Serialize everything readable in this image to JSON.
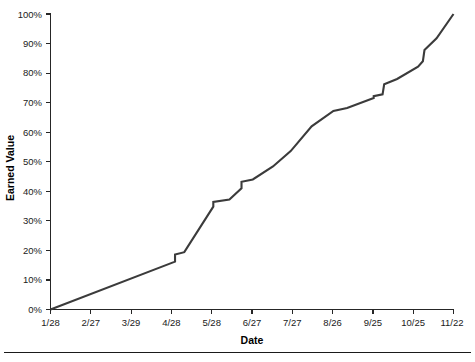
{
  "chart_data": {
    "type": "line",
    "title": "",
    "xlabel": "Date",
    "ylabel": "Earned Value",
    "xtick_labels": [
      "1/28",
      "2/27",
      "3/29",
      "4/28",
      "5/28",
      "6/27",
      "7/27",
      "8/26",
      "9/25",
      "10/25",
      "11/22"
    ],
    "ytick_labels": [
      "0%",
      "10%",
      "20%",
      "30%",
      "40%",
      "50%",
      "60%",
      "70%",
      "80%",
      "90%",
      "100%"
    ],
    "ylim": [
      0,
      100
    ],
    "xlim": [
      0,
      10
    ],
    "grid": false,
    "legend": false,
    "series": [
      {
        "name": "Earned Value",
        "color": "#3b3b3b",
        "x": [
          0.0,
          0.3,
          1.0,
          2.0,
          3.0,
          3.12,
          3.12,
          3.3,
          4.05,
          4.05,
          4.45,
          4.75,
          4.75,
          5.05,
          5.55,
          5.95,
          5.95,
          6.45,
          7.05,
          7.05,
          7.35,
          8.0,
          8.25,
          8.25,
          8.6,
          9.1,
          10.0
        ],
        "y": [
          0.0,
          2.4,
          5.6,
          10.3,
          15.5,
          16.2,
          18.6,
          19.2,
          34.5,
          36.0,
          36.2,
          40.5,
          42.0,
          43.8,
          48.0,
          48.0,
          53.0,
          62.0,
          66.8,
          67.5,
          69.0,
          71.8,
          72.0,
          78.0,
          80.0,
          83.0,
          84.0
        ],
        "y_note": "stepped cumulative earned-value curve rising from 0% to 100%"
      }
    ],
    "series_points_full": [
      [
        0.0,
        0.0
      ],
      [
        3.09,
        16.2
      ],
      [
        3.09,
        18.6
      ],
      [
        3.32,
        19.4
      ],
      [
        4.04,
        34.8
      ],
      [
        4.04,
        36.4
      ],
      [
        4.44,
        37.2
      ],
      [
        4.74,
        41.0
      ],
      [
        4.74,
        43.2
      ],
      [
        5.02,
        44.0
      ],
      [
        5.52,
        48.4
      ],
      [
        5.96,
        53.6
      ],
      [
        6.48,
        62.0
      ],
      [
        7.02,
        67.2
      ],
      [
        7.36,
        68.2
      ],
      [
        8.02,
        71.6
      ],
      [
        8.02,
        72.2
      ],
      [
        8.24,
        72.8
      ],
      [
        8.28,
        76.2
      ],
      [
        8.6,
        78.0
      ],
      [
        9.12,
        82.2
      ],
      [
        9.24,
        84.0
      ],
      [
        9.28,
        87.8
      ],
      [
        9.58,
        91.8
      ],
      [
        10.0,
        100.0
      ]
    ],
    "endpoints": {
      "start": {
        "x_label": "1/28",
        "value": "0%"
      },
      "end": {
        "x_label": "11/22",
        "value": "100%"
      }
    }
  },
  "figure": {
    "caption": ""
  }
}
